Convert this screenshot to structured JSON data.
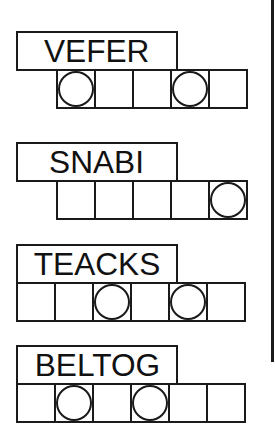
{
  "puzzle": {
    "type": "jumble",
    "accent_color": "#1a1a1a",
    "words": [
      {
        "scrambled": "VEFER",
        "letter_count": 5,
        "cells_offset": 1,
        "circled_positions": [
          1,
          4
        ],
        "answer_cells": [
          "",
          "",
          "",
          "",
          ""
        ]
      },
      {
        "scrambled": "SNABI",
        "letter_count": 5,
        "cells_offset": 1,
        "circled_positions": [
          5
        ],
        "answer_cells": [
          "",
          "",
          "",
          "",
          ""
        ]
      },
      {
        "scrambled": "TEACKS",
        "letter_count": 6,
        "cells_offset": 0,
        "circled_positions": [
          3,
          5
        ],
        "answer_cells": [
          "",
          "",
          "",
          "",
          "",
          ""
        ]
      },
      {
        "scrambled": "BELTOG",
        "letter_count": 6,
        "cells_offset": 0,
        "circled_positions": [
          2,
          4
        ],
        "answer_cells": [
          "",
          "",
          "",
          "",
          "",
          ""
        ]
      }
    ]
  }
}
